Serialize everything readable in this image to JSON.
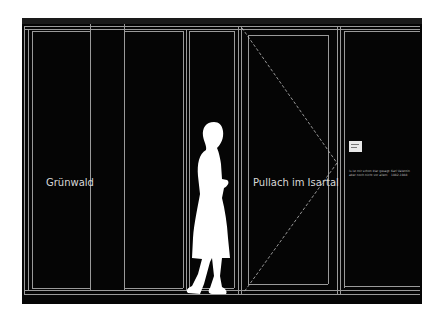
{
  "scene": {
    "type": "architectural elevation drawing",
    "background": "#050505",
    "line_color": "#9a9a9a"
  },
  "labels": {
    "left_panel": "Grünwald",
    "right_panel": "Pullach im Isartal"
  },
  "info_panel": {
    "text_left": [
      "Is ist mir schon klar gesagt",
      "aber noch nicht vor allem"
    ],
    "text_right": [
      "Karl Valentin",
      "1882-1948"
    ]
  }
}
